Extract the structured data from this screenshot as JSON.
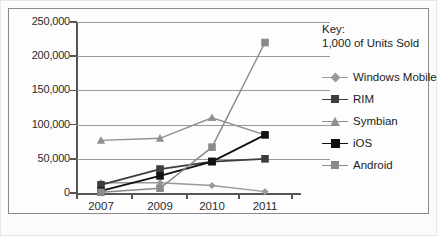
{
  "chart_data": {
    "type": "line",
    "title": "",
    "xlabel": "",
    "ylabel": "",
    "categories": [
      "2007",
      "2009",
      "2010",
      "2011"
    ],
    "ylim": [
      0,
      250000
    ],
    "ytick_values": [
      0,
      50000,
      100000,
      150000,
      200000,
      250000
    ],
    "ytick_labels": [
      "0",
      "50,000",
      "100,000",
      "150,000",
      "200,000",
      "250,000"
    ],
    "grid": true,
    "legend_position": "right",
    "legend_title": "Key:\n1,000 of Units Sold",
    "series": [
      {
        "name": "Windows Mobile",
        "values": [
          15000,
          15000,
          11000,
          2000
        ],
        "color": "#9a9a9a",
        "marker": "diamond"
      },
      {
        "name": "RIM",
        "values": [
          12000,
          35000,
          46000,
          50000
        ],
        "color": "#3d3d3d",
        "marker": "square"
      },
      {
        "name": "Symbian",
        "values": [
          77000,
          80000,
          110000,
          85000
        ],
        "color": "#8f8f8f",
        "marker": "triangle"
      },
      {
        "name": "iOS",
        "values": [
          3000,
          25000,
          46000,
          85000
        ],
        "color": "#111111",
        "marker": "square"
      },
      {
        "name": "Android",
        "values": [
          1000,
          7000,
          67000,
          220000
        ],
        "color": "#8a8a8a",
        "marker": "square"
      }
    ]
  }
}
